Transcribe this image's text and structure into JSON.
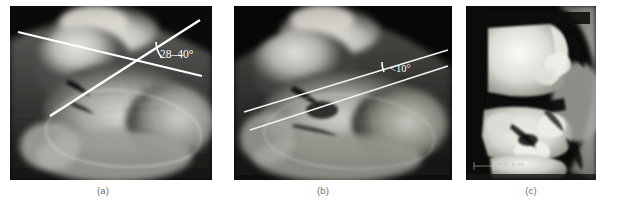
{
  "figure": {
    "background_color": "#ffffff",
    "panel_count": 3
  },
  "panels": [
    {
      "id": "a",
      "caption": "(a)",
      "modality": "lateral-radiograph",
      "region": "calcaneus",
      "annotation": {
        "label": "28–40°",
        "color": "#ffffff",
        "type": "bohler-angle-normal",
        "line_count": 2
      }
    },
    {
      "id": "b",
      "caption": "(b)",
      "modality": "lateral-radiograph",
      "region": "calcaneus",
      "annotation": {
        "label": "<10°",
        "color": "#ffffff",
        "type": "bohler-angle-reduced",
        "line_count": 2
      }
    },
    {
      "id": "c",
      "caption": "(c)",
      "modality": "ct-reconstruction",
      "region": "calcaneus",
      "annotation": {
        "label": "",
        "color": "#ffffff",
        "type": "none",
        "line_count": 0
      }
    }
  ],
  "colors": {
    "annotation_line": "#ffffff",
    "annotation_line_b": "#f2f2f2",
    "caption_text": "#6f6f6f",
    "page_background": "#ffffff",
    "panel_background": "#000000"
  }
}
